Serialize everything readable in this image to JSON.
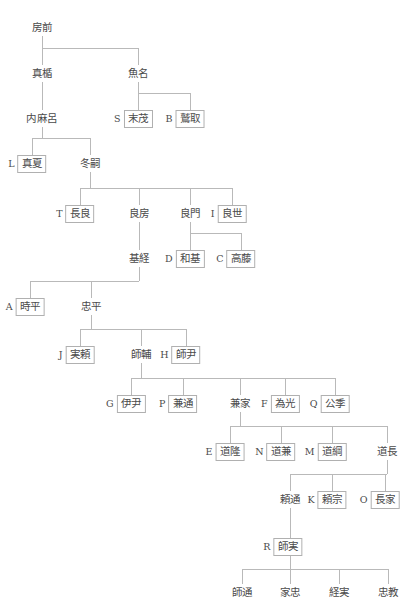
{
  "diagram": {
    "line_color": "#b9b9b9",
    "box_border_color": "#b0b0b0",
    "text_color": "#4a4a4a",
    "background": "#ffffff"
  },
  "nodes": [
    {
      "id": "fusasaki",
      "tag": "",
      "name": "房前",
      "boxed": false,
      "cx": 42,
      "y": 19
    },
    {
      "id": "matate",
      "tag": "",
      "name": "真楯",
      "boxed": false,
      "cx": 42,
      "y": 65
    },
    {
      "id": "uona",
      "tag": "",
      "name": "魚名",
      "boxed": false,
      "cx": 138,
      "y": 65
    },
    {
      "id": "uchimaro",
      "tag": "",
      "name": "内麻呂",
      "boxed": false,
      "cx": 42,
      "y": 110
    },
    {
      "id": "suemochi",
      "tag": "S",
      "name": "末茂",
      "boxed": true,
      "cx": 138,
      "y": 110
    },
    {
      "id": "washitori",
      "tag": "B",
      "name": "鷲取",
      "boxed": true,
      "cx": 190,
      "y": 110
    },
    {
      "id": "manatsu",
      "tag": "L",
      "name": "真夏",
      "boxed": true,
      "cx": 32,
      "y": 155
    },
    {
      "id": "fuyutsugu",
      "tag": "",
      "name": "冬嗣",
      "boxed": false,
      "cx": 90,
      "y": 155
    },
    {
      "id": "nagara",
      "tag": "T",
      "name": "長良",
      "boxed": true,
      "cx": 80,
      "y": 205
    },
    {
      "id": "yoshifusa",
      "tag": "",
      "name": "良房",
      "boxed": false,
      "cx": 139,
      "y": 205
    },
    {
      "id": "yoshikado",
      "tag": "",
      "name": "良門",
      "boxed": false,
      "cx": 190,
      "y": 205
    },
    {
      "id": "yoshiyo",
      "tag": "I",
      "name": "良世",
      "boxed": true,
      "cx": 232,
      "y": 205
    },
    {
      "id": "mototsune",
      "tag": "",
      "name": "基経",
      "boxed": false,
      "cx": 139,
      "y": 250
    },
    {
      "id": "motoki",
      "tag": "D",
      "name": "和基",
      "boxed": true,
      "cx": 190,
      "y": 250
    },
    {
      "id": "takafuji",
      "tag": "C",
      "name": "高藤",
      "boxed": true,
      "cx": 241,
      "y": 250
    },
    {
      "id": "tokihira",
      "tag": "A",
      "name": "時平",
      "boxed": true,
      "cx": 30,
      "y": 298
    },
    {
      "id": "tadahira",
      "tag": "",
      "name": "忠平",
      "boxed": false,
      "cx": 91,
      "y": 298
    },
    {
      "id": "saneyori",
      "tag": "J",
      "name": "実頼",
      "boxed": true,
      "cx": 80,
      "y": 346
    },
    {
      "id": "morosuke",
      "tag": "",
      "name": "師輔",
      "boxed": false,
      "cx": 141,
      "y": 346
    },
    {
      "id": "morotada",
      "tag": "H",
      "name": "師尹",
      "boxed": true,
      "cx": 186,
      "y": 346
    },
    {
      "id": "koretada",
      "tag": "G",
      "name": "伊尹",
      "boxed": true,
      "cx": 131,
      "y": 395
    },
    {
      "id": "kanemichi",
      "tag": "P",
      "name": "兼通",
      "boxed": true,
      "cx": 183,
      "y": 395
    },
    {
      "id": "kaneie",
      "tag": "",
      "name": "兼家",
      "boxed": false,
      "cx": 240,
      "y": 395
    },
    {
      "id": "tamemitsu",
      "tag": "F",
      "name": "為光",
      "boxed": true,
      "cx": 285,
      "y": 395
    },
    {
      "id": "kinsue",
      "tag": "Q",
      "name": "公季",
      "boxed": true,
      "cx": 335,
      "y": 395
    },
    {
      "id": "michitaka",
      "tag": "E",
      "name": "道隆",
      "boxed": true,
      "cx": 230,
      "y": 443
    },
    {
      "id": "michikane",
      "tag": "N",
      "name": "道兼",
      "boxed": true,
      "cx": 281,
      "y": 443
    },
    {
      "id": "michitsuna",
      "tag": "M",
      "name": "道綱",
      "boxed": true,
      "cx": 332,
      "y": 443
    },
    {
      "id": "michinaga",
      "tag": "",
      "name": "道長",
      "boxed": false,
      "cx": 387,
      "y": 443
    },
    {
      "id": "yorimichi",
      "tag": "",
      "name": "頼通",
      "boxed": false,
      "cx": 290,
      "y": 491
    },
    {
      "id": "yorimune",
      "tag": "K",
      "name": "頼宗",
      "boxed": true,
      "cx": 332,
      "y": 491
    },
    {
      "id": "nagaie",
      "tag": "O",
      "name": "長家",
      "boxed": true,
      "cx": 385,
      "y": 491
    },
    {
      "id": "morozane",
      "tag": "R",
      "name": "師実",
      "boxed": true,
      "cx": 288,
      "y": 538
    },
    {
      "id": "moromichi",
      "tag": "",
      "name": "師通",
      "boxed": false,
      "cx": 242,
      "y": 584
    },
    {
      "id": "ietada",
      "tag": "",
      "name": "家忠",
      "boxed": false,
      "cx": 290,
      "y": 584
    },
    {
      "id": "tsunezane",
      "tag": "",
      "name": "経実",
      "boxed": false,
      "cx": 339,
      "y": 584
    },
    {
      "id": "tadanori",
      "tag": "",
      "name": "忠教",
      "boxed": false,
      "cx": 388,
      "y": 584
    }
  ],
  "edges": [
    {
      "id": "e-fusasaki-drop",
      "type": "v",
      "x": 42,
      "y": 36,
      "len": 12
    },
    {
      "id": "e-fusasaki-bar",
      "type": "h",
      "x": 42,
      "y": 48,
      "len": 96
    },
    {
      "id": "e-matate-up",
      "type": "v",
      "x": 42,
      "y": 48,
      "len": 17
    },
    {
      "id": "e-uona-up",
      "type": "v",
      "x": 138,
      "y": 48,
      "len": 17
    },
    {
      "id": "e-matate-down",
      "type": "v",
      "x": 42,
      "y": 82,
      "len": 28
    },
    {
      "id": "e-uona-drop",
      "type": "v",
      "x": 138,
      "y": 82,
      "len": 11
    },
    {
      "id": "e-uona-bar",
      "type": "h",
      "x": 138,
      "y": 93,
      "len": 52
    },
    {
      "id": "e-suemochi-up",
      "type": "v",
      "x": 138,
      "y": 93,
      "len": 17
    },
    {
      "id": "e-washitori-up",
      "type": "v",
      "x": 190,
      "y": 93,
      "len": 17
    },
    {
      "id": "e-uchimaro-drop",
      "type": "v",
      "x": 42,
      "y": 127,
      "len": 11
    },
    {
      "id": "e-uchimaro-bar",
      "type": "h",
      "x": 32,
      "y": 138,
      "len": 58
    },
    {
      "id": "e-manatsu-up",
      "type": "v",
      "x": 32,
      "y": 138,
      "len": 17
    },
    {
      "id": "e-fuyutsugu-up",
      "type": "v",
      "x": 90,
      "y": 138,
      "len": 17
    },
    {
      "id": "e-fuyutsugu-drop",
      "type": "v",
      "x": 90,
      "y": 172,
      "len": 16
    },
    {
      "id": "e-fuyutsugu-bar",
      "type": "h",
      "x": 80,
      "y": 188,
      "len": 152
    },
    {
      "id": "e-nagara-up",
      "type": "v",
      "x": 80,
      "y": 188,
      "len": 17
    },
    {
      "id": "e-yoshifusa-up",
      "type": "v",
      "x": 139,
      "y": 188,
      "len": 17
    },
    {
      "id": "e-yoshikado-up",
      "type": "v",
      "x": 190,
      "y": 188,
      "len": 17
    },
    {
      "id": "e-yoshiyo-up",
      "type": "v",
      "x": 232,
      "y": 188,
      "len": 17
    },
    {
      "id": "e-yoshifusa-down",
      "type": "v",
      "x": 139,
      "y": 222,
      "len": 28
    },
    {
      "id": "e-yoshikado-drop",
      "type": "v",
      "x": 190,
      "y": 222,
      "len": 11
    },
    {
      "id": "e-yoshikado-bar",
      "type": "h",
      "x": 190,
      "y": 233,
      "len": 51
    },
    {
      "id": "e-motoki-up",
      "type": "v",
      "x": 190,
      "y": 233,
      "len": 17
    },
    {
      "id": "e-takafuji-up",
      "type": "v",
      "x": 241,
      "y": 233,
      "len": 17
    },
    {
      "id": "e-mototsune-drop",
      "type": "v",
      "x": 139,
      "y": 267,
      "len": 14
    },
    {
      "id": "e-mototsune-bar",
      "type": "h",
      "x": 30,
      "y": 281,
      "len": 109
    },
    {
      "id": "e-tokihira-up",
      "type": "v",
      "x": 30,
      "y": 281,
      "len": 17
    },
    {
      "id": "e-tadahira-up",
      "type": "v",
      "x": 91,
      "y": 281,
      "len": 17
    },
    {
      "id": "e-tadahira-drop",
      "type": "v",
      "x": 91,
      "y": 315,
      "len": 14
    },
    {
      "id": "e-tadahira-bar",
      "type": "h",
      "x": 80,
      "y": 329,
      "len": 106
    },
    {
      "id": "e-saneyori-up",
      "type": "v",
      "x": 80,
      "y": 329,
      "len": 17
    },
    {
      "id": "e-morosuke-up",
      "type": "v",
      "x": 141,
      "y": 329,
      "len": 17
    },
    {
      "id": "e-morotada-up",
      "type": "v",
      "x": 186,
      "y": 329,
      "len": 17
    },
    {
      "id": "e-morosuke-drop",
      "type": "v",
      "x": 141,
      "y": 363,
      "len": 15
    },
    {
      "id": "e-morosuke-bar",
      "type": "h",
      "x": 131,
      "y": 378,
      "len": 204
    },
    {
      "id": "e-koretada-up",
      "type": "v",
      "x": 131,
      "y": 378,
      "len": 17
    },
    {
      "id": "e-kanemichi-up",
      "type": "v",
      "x": 183,
      "y": 378,
      "len": 17
    },
    {
      "id": "e-kaneie-up",
      "type": "v",
      "x": 240,
      "y": 378,
      "len": 17
    },
    {
      "id": "e-tamemitsu-up",
      "type": "v",
      "x": 285,
      "y": 378,
      "len": 17
    },
    {
      "id": "e-kinsue-up",
      "type": "v",
      "x": 335,
      "y": 378,
      "len": 17
    },
    {
      "id": "e-kaneie-drop",
      "type": "v",
      "x": 240,
      "y": 412,
      "len": 14
    },
    {
      "id": "e-kaneie-bar",
      "type": "h",
      "x": 230,
      "y": 426,
      "len": 157
    },
    {
      "id": "e-michitaka-up",
      "type": "v",
      "x": 230,
      "y": 426,
      "len": 17
    },
    {
      "id": "e-michikane-up",
      "type": "v",
      "x": 281,
      "y": 426,
      "len": 17
    },
    {
      "id": "e-michitsuna-up",
      "type": "v",
      "x": 332,
      "y": 426,
      "len": 17
    },
    {
      "id": "e-michinaga-up",
      "type": "v",
      "x": 387,
      "y": 426,
      "len": 17
    },
    {
      "id": "e-michinaga-drop",
      "type": "v",
      "x": 387,
      "y": 460,
      "len": 14
    },
    {
      "id": "e-michinaga-bar",
      "type": "h",
      "x": 290,
      "y": 474,
      "len": 97
    },
    {
      "id": "e-yorimichi-up",
      "type": "v",
      "x": 290,
      "y": 474,
      "len": 17
    },
    {
      "id": "e-yorimune-up",
      "type": "v",
      "x": 332,
      "y": 474,
      "len": 17
    },
    {
      "id": "e-nagaie-up",
      "type": "v",
      "x": 385,
      "y": 474,
      "len": 17
    },
    {
      "id": "e-yorimichi-down",
      "type": "v",
      "x": 290,
      "y": 508,
      "len": 30
    },
    {
      "id": "e-morozane-drop",
      "type": "v",
      "x": 290,
      "y": 555,
      "len": 14
    },
    {
      "id": "e-morozane-bar",
      "type": "h",
      "x": 242,
      "y": 569,
      "len": 146
    },
    {
      "id": "e-moromichi-up",
      "type": "v",
      "x": 242,
      "y": 569,
      "len": 15
    },
    {
      "id": "e-ietada-up",
      "type": "v",
      "x": 290,
      "y": 569,
      "len": 15
    },
    {
      "id": "e-tsunezane-up",
      "type": "v",
      "x": 339,
      "y": 569,
      "len": 15
    },
    {
      "id": "e-tadanori-up",
      "type": "v",
      "x": 388,
      "y": 569,
      "len": 15
    }
  ]
}
